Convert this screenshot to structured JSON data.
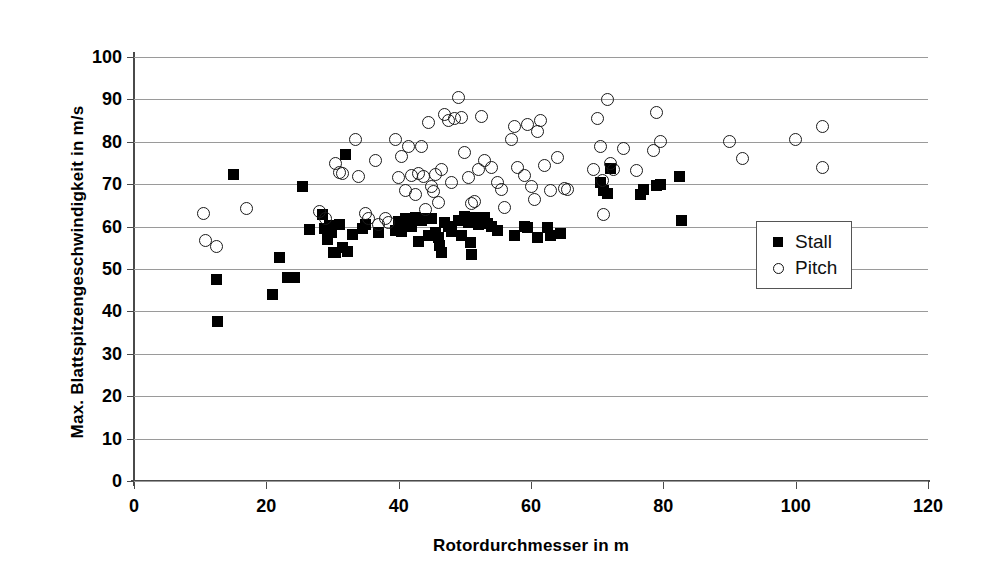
{
  "chart_data": {
    "type": "scatter",
    "title": "",
    "xlabel": "Rotordurchmesser in m",
    "ylabel": "Max. Blattspitzengeschwindigkeit in m/s",
    "xlim": [
      0,
      120
    ],
    "ylim": [
      0,
      100
    ],
    "xticks": [
      0,
      20,
      40,
      60,
      80,
      100,
      120
    ],
    "yticks": [
      0,
      10,
      20,
      30,
      40,
      50,
      60,
      70,
      80,
      90,
      100
    ],
    "grid": "horizontal",
    "legend_position": "right-middle",
    "series": [
      {
        "name": "Stall",
        "marker": "filled-square",
        "color": "#000000",
        "points": [
          [
            12.5,
            47.5
          ],
          [
            12.6,
            37.6
          ],
          [
            15.0,
            72.2
          ],
          [
            21.0,
            44.0
          ],
          [
            22.0,
            52.8
          ],
          [
            23.2,
            48.0
          ],
          [
            24.3,
            48.0
          ],
          [
            25.5,
            69.5
          ],
          [
            26.5,
            59.2
          ],
          [
            28.5,
            62.8
          ],
          [
            28.8,
            59.5
          ],
          [
            29.2,
            57.0
          ],
          [
            29.5,
            60.3
          ],
          [
            29.8,
            58.6
          ],
          [
            30.2,
            54.0
          ],
          [
            30.5,
            53.8
          ],
          [
            31.0,
            60.5
          ],
          [
            31.5,
            55.0
          ],
          [
            32.0,
            77.1
          ],
          [
            32.3,
            54.2
          ],
          [
            33.0,
            58.2
          ],
          [
            34.5,
            59.5
          ],
          [
            35.0,
            60.5
          ],
          [
            37.0,
            58.6
          ],
          [
            39.5,
            59.0
          ],
          [
            40.0,
            61.2
          ],
          [
            40.5,
            58.8
          ],
          [
            41.0,
            62.0
          ],
          [
            41.5,
            61.0
          ],
          [
            42.0,
            60.0
          ],
          [
            42.5,
            62.2
          ],
          [
            43.0,
            56.6
          ],
          [
            43.5,
            61.5
          ],
          [
            44.0,
            62.0
          ],
          [
            44.5,
            58.0
          ],
          [
            45.0,
            61.8
          ],
          [
            45.5,
            58.5
          ],
          [
            46.0,
            57.5
          ],
          [
            46.2,
            55.5
          ],
          [
            46.5,
            53.8
          ],
          [
            47.0,
            61.0
          ],
          [
            47.5,
            60.0
          ],
          [
            48.0,
            58.8
          ],
          [
            49.0,
            61.5
          ],
          [
            49.5,
            58.0
          ],
          [
            50.0,
            62.5
          ],
          [
            50.5,
            61.0
          ],
          [
            50.8,
            56.2
          ],
          [
            51.0,
            53.5
          ],
          [
            51.5,
            62.2
          ],
          [
            52.0,
            60.5
          ],
          [
            52.5,
            61.0
          ],
          [
            53.0,
            62.2
          ],
          [
            53.5,
            60.8
          ],
          [
            54.0,
            60.0
          ],
          [
            55.0,
            59.0
          ],
          [
            57.5,
            57.8
          ],
          [
            59.0,
            60.0
          ],
          [
            59.5,
            59.8
          ],
          [
            61.0,
            57.5
          ],
          [
            62.5,
            59.8
          ],
          [
            63.0,
            57.8
          ],
          [
            64.5,
            58.3
          ],
          [
            70.5,
            70.5
          ],
          [
            71.0,
            68.5
          ],
          [
            71.5,
            67.8
          ],
          [
            72.0,
            73.8
          ],
          [
            76.5,
            67.5
          ],
          [
            77.0,
            68.8
          ],
          [
            79.0,
            69.8
          ],
          [
            79.5,
            70.0
          ],
          [
            82.5,
            71.8
          ],
          [
            82.8,
            61.5
          ]
        ]
      },
      {
        "name": "Pitch",
        "marker": "open-circle",
        "color": "#1a1a1a",
        "points": [
          [
            10.5,
            63.0
          ],
          [
            10.8,
            56.8
          ],
          [
            12.5,
            55.2
          ],
          [
            17.0,
            64.2
          ],
          [
            28.0,
            63.5
          ],
          [
            29.0,
            62.0
          ],
          [
            30.5,
            74.8
          ],
          [
            31.0,
            72.8
          ],
          [
            31.5,
            72.5
          ],
          [
            33.5,
            80.5
          ],
          [
            34.0,
            71.8
          ],
          [
            35.0,
            63.0
          ],
          [
            35.5,
            61.8
          ],
          [
            36.5,
            75.5
          ],
          [
            37.0,
            60.5
          ],
          [
            38.0,
            62.0
          ],
          [
            38.5,
            61.0
          ],
          [
            39.5,
            80.5
          ],
          [
            40.0,
            71.5
          ],
          [
            40.5,
            76.5
          ],
          [
            41.0,
            68.5
          ],
          [
            41.5,
            79.0
          ],
          [
            42.0,
            72.0
          ],
          [
            42.5,
            67.5
          ],
          [
            43.0,
            72.5
          ],
          [
            43.5,
            78.8
          ],
          [
            43.8,
            71.8
          ],
          [
            44.0,
            64.0
          ],
          [
            44.5,
            84.5
          ],
          [
            45.0,
            69.5
          ],
          [
            45.3,
            68.2
          ],
          [
            45.5,
            72.2
          ],
          [
            46.0,
            65.8
          ],
          [
            46.5,
            73.5
          ],
          [
            47.0,
            86.5
          ],
          [
            47.5,
            85.0
          ],
          [
            48.0,
            70.5
          ],
          [
            48.5,
            85.5
          ],
          [
            49.0,
            90.5
          ],
          [
            49.5,
            85.8
          ],
          [
            50.0,
            77.5
          ],
          [
            50.5,
            71.5
          ],
          [
            51.0,
            65.5
          ],
          [
            51.5,
            66.0
          ],
          [
            52.0,
            73.5
          ],
          [
            52.5,
            86.0
          ],
          [
            53.0,
            75.5
          ],
          [
            54.0,
            74.0
          ],
          [
            55.0,
            70.5
          ],
          [
            55.5,
            68.8
          ],
          [
            56.0,
            64.5
          ],
          [
            57.0,
            80.5
          ],
          [
            57.5,
            83.5
          ],
          [
            58.0,
            74.0
          ],
          [
            59.0,
            72.0
          ],
          [
            59.5,
            84.0
          ],
          [
            60.0,
            69.5
          ],
          [
            60.5,
            66.5
          ],
          [
            61.0,
            82.5
          ],
          [
            61.5,
            85.0
          ],
          [
            62.0,
            74.5
          ],
          [
            63.0,
            68.5
          ],
          [
            64.0,
            76.2
          ],
          [
            65.0,
            69.0
          ],
          [
            65.5,
            68.8
          ],
          [
            69.5,
            73.5
          ],
          [
            70.0,
            85.5
          ],
          [
            70.5,
            79.0
          ],
          [
            70.8,
            70.8
          ],
          [
            71.0,
            62.8
          ],
          [
            71.5,
            90.0
          ],
          [
            72.0,
            75.0
          ],
          [
            72.5,
            73.5
          ],
          [
            74.0,
            78.5
          ],
          [
            76.0,
            73.2
          ],
          [
            78.5,
            78.0
          ],
          [
            79.0,
            87.0
          ],
          [
            79.5,
            80.0
          ],
          [
            90.0,
            80.0
          ],
          [
            92.0,
            76.0
          ],
          [
            100.0,
            80.5
          ],
          [
            104.0,
            83.5
          ],
          [
            104.0,
            74.0
          ]
        ]
      }
    ]
  },
  "axes": {
    "y_tick_labels": [
      "100",
      "90",
      "80",
      "70",
      "60",
      "50",
      "40",
      "30",
      "20",
      "10",
      "0"
    ],
    "x_tick_labels": [
      "0",
      "20",
      "40",
      "60",
      "80",
      "100",
      "120"
    ]
  },
  "legend": {
    "items": [
      {
        "label": "Stall",
        "marker": "filled-square"
      },
      {
        "label": "Pitch",
        "marker": "open-circle"
      }
    ]
  }
}
